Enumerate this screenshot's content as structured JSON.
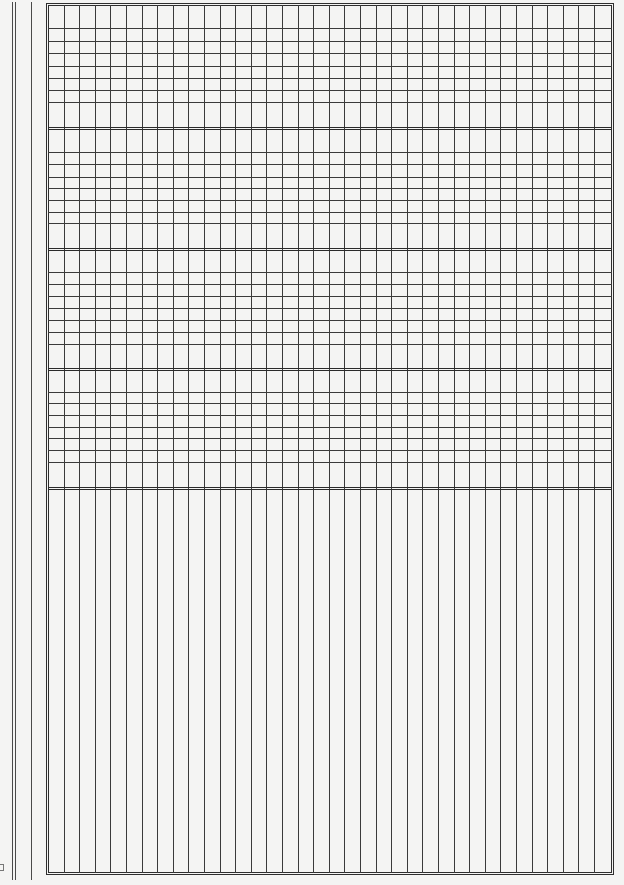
{
  "page": {
    "type": "semi-log graph paper (4 cycles, blank)",
    "width": 624,
    "height": 885,
    "background_color": "#f4f4f3",
    "line_color": "#3a3a3a"
  },
  "margin_lines": [
    {
      "x": 12,
      "top": 2,
      "bottom": 880
    },
    {
      "x": 15,
      "top": 2,
      "bottom": 880
    },
    {
      "x": 31,
      "top": 2,
      "bottom": 880
    }
  ],
  "grid": {
    "left": 46,
    "top": 3,
    "right": 614,
    "bottom": 875,
    "double_border_gap": 2,
    "column_spacing": 15.6,
    "column_count": 36,
    "decades": [
      {
        "top": 3,
        "bottom": 128,
        "minor_lines": [
          28,
          41,
          53,
          66,
          78,
          90,
          102
        ]
      },
      {
        "top": 128,
        "bottom": 249,
        "minor_lines": [
          152,
          164,
          177,
          188,
          200,
          212,
          223
        ]
      },
      {
        "top": 249,
        "bottom": 369,
        "minor_lines": [
          272,
          284,
          296,
          308,
          320,
          332,
          344
        ]
      },
      {
        "top": 369,
        "bottom": 488,
        "minor_lines": [
          392,
          403,
          415,
          427,
          438,
          450,
          462
        ]
      }
    ],
    "lower_region": {
      "top": 488,
      "bottom": 875,
      "horizontal_lines": []
    }
  },
  "scan_artifacts": [
    {
      "x": 0,
      "y": 864,
      "description": "cropped illegible glyph at page edge"
    }
  ]
}
